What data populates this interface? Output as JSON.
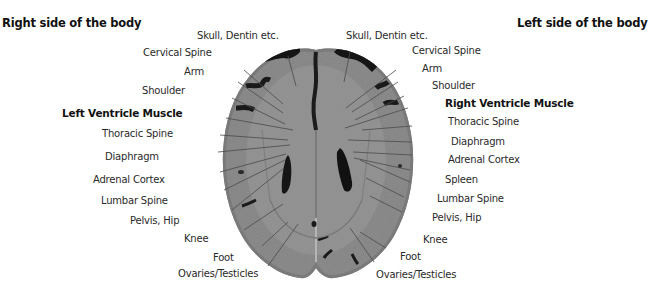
{
  "headers": {
    "right_side": "Right side of the body",
    "left_side": "Left side of the body"
  },
  "left_labels": [
    {
      "text": "Skull, Dentin etc.",
      "bold": false
    },
    {
      "text": "Cervical Spine",
      "bold": false
    },
    {
      "text": "Arm",
      "bold": false
    },
    {
      "text": "Shoulder",
      "bold": false
    },
    {
      "text": "Left Ventricle Muscle",
      "bold": true
    },
    {
      "text": "Thoracic Spine",
      "bold": false
    },
    {
      "text": "Diaphragm",
      "bold": false
    },
    {
      "text": "Adrenal Cortex",
      "bold": false
    },
    {
      "text": "Lumbar Spine",
      "bold": false
    },
    {
      "text": "Pelvis, Hip",
      "bold": false
    },
    {
      "text": "Knee",
      "bold": false
    },
    {
      "text": "Foot",
      "bold": false
    },
    {
      "text": "Ovaries/Testicles",
      "bold": false
    }
  ],
  "right_labels": [
    {
      "text": "Skull, Dentin etc.",
      "bold": false
    },
    {
      "text": "Cervical Spine",
      "bold": false
    },
    {
      "text": "Arm",
      "bold": false
    },
    {
      "text": "Shoulder",
      "bold": false
    },
    {
      "text": "Right Ventricle Muscle",
      "bold": true
    },
    {
      "text": "Thoracic Spine",
      "bold": false
    },
    {
      "text": "Diaphragm",
      "bold": false
    },
    {
      "text": "Adrenal Cortex",
      "bold": false
    },
    {
      "text": "Spleen",
      "bold": false
    },
    {
      "text": "Lumbar Spine",
      "bold": false
    },
    {
      "text": "Pelvis, Hip",
      "bold": false
    },
    {
      "text": "Knee",
      "bold": false
    },
    {
      "text": "Foot",
      "bold": false
    },
    {
      "text": "Ovaries/Testicles",
      "bold": false
    }
  ],
  "image": {
    "subject": "axial brain CT slice",
    "colors": {
      "tissue": "#8d8d8d",
      "dark_regions": "#1a1a1a",
      "leader_lines": "#4a4a4a"
    }
  }
}
